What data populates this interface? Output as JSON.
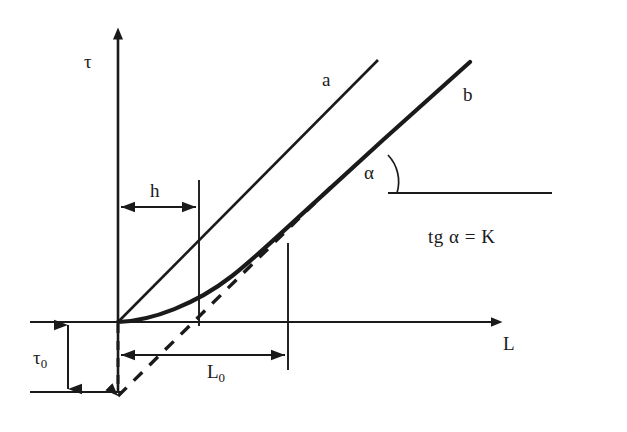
{
  "figure": {
    "kind": "technical-line-diagram",
    "background_color": "#ffffff",
    "ink_color": "#1a1a1a"
  },
  "axes": {
    "y_axis_label": "τ",
    "x_axis_label": "L",
    "y_axis": {
      "x": 118,
      "y_top": 30,
      "y_bottom": 392
    },
    "x_axis": {
      "y": 322,
      "x_left": 30,
      "x_right": 500
    },
    "origin": {
      "x": 118,
      "y": 322
    }
  },
  "curves": {
    "line_a": {
      "label": "a",
      "label_pos": {
        "x": 322,
        "y": 70
      },
      "start": {
        "x": 118,
        "y": 322
      },
      "end": {
        "x": 378,
        "y": 60
      },
      "stroke_width": 2.6
    },
    "curve_b": {
      "label": "b",
      "label_pos": {
        "x": 463,
        "y": 85
      },
      "start": {
        "x": 118,
        "y": 322
      },
      "end": {
        "x": 470,
        "y": 62
      },
      "stroke_width": 4.2
    },
    "tangent_dashed": {
      "start": {
        "x": 118,
        "y": 392
      },
      "end": {
        "x": 330,
        "y": 188
      },
      "dash_pattern": "11,9",
      "stroke_width": 3.4
    }
  },
  "annotations": {
    "h": {
      "label": "h",
      "label_pos": {
        "x": 150,
        "y": 181
      },
      "arrow_y": 207,
      "x_from": 118,
      "x_to": 199
    },
    "L0": {
      "label": "L",
      "subscript": "0",
      "label_pos": {
        "x": 207,
        "y": 362
      },
      "arrow_y": 355,
      "x_from": 118,
      "x_to": 288
    },
    "tau0": {
      "label": "τ",
      "subscript": "0",
      "label_pos": {
        "x": 33,
        "y": 348
      },
      "arrow_x": 68,
      "y_from": 322,
      "y_to": 392
    },
    "alpha": {
      "label": "α",
      "label_pos": {
        "x": 364,
        "y": 163
      },
      "vertex": {
        "x": 390,
        "y": 193
      },
      "ray_x_end": 550
    },
    "tg_formula": {
      "text": "tg α = K",
      "label_pos": {
        "x": 428,
        "y": 227
      }
    }
  },
  "guides": {
    "vertical_at_h": {
      "x": 199,
      "y_top": 180,
      "y_bottom": 322
    },
    "vertical_at_L0": {
      "x": 288,
      "y_top": 243,
      "y_bottom": 370
    },
    "dashed_vertical_origin": {
      "x": 118,
      "y_top": 322,
      "y_bottom": 395
    },
    "bottom_baseline": {
      "y": 392,
      "x_left": 30,
      "x_right": 120
    }
  }
}
